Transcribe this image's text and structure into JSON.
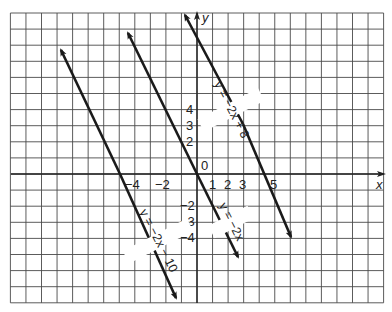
{
  "axes": {
    "x_label": "x",
    "y_label": "y",
    "origin_label": "0",
    "x_tick_labels": [
      {
        "value": -4,
        "text": "−4"
      },
      {
        "value": -2,
        "text": "−2"
      },
      {
        "value": 1,
        "text": "1"
      },
      {
        "value": 2,
        "text": "2"
      },
      {
        "value": 3,
        "text": "3"
      },
      {
        "value": 5,
        "text": "5"
      }
    ],
    "y_tick_labels": [
      {
        "value": 4,
        "text": "4"
      },
      {
        "value": 3,
        "text": "3"
      },
      {
        "value": 2,
        "text": "2"
      },
      {
        "value": -2,
        "text": "−2"
      },
      {
        "value": -3,
        "text": "−3"
      },
      {
        "value": -4,
        "text": "−4"
      }
    ]
  },
  "lines": [
    {
      "name": "y = -2x + 8",
      "label": "y = −2x + 8",
      "slope": -2,
      "intercept": 8
    },
    {
      "name": "y = -2x",
      "label": "y = −2x",
      "slope": -2,
      "intercept": 0
    },
    {
      "name": "y = -2x - 10",
      "label": "y = −2x − 10",
      "slope": -2,
      "intercept": -10
    }
  ],
  "chart_data": {
    "type": "line",
    "title": "",
    "xlabel": "x",
    "ylabel": "y",
    "xlim": [
      -12,
      12
    ],
    "ylim": [
      -8,
      10
    ],
    "grid": true,
    "series": [
      {
        "name": "y = -2x + 8",
        "x": [
          -0.8,
          6.1
        ],
        "y": [
          9.6,
          -4.2
        ]
      },
      {
        "name": "y = -2x",
        "x": [
          -4.4,
          2.6
        ],
        "y": [
          8.8,
          -5.2
        ]
      },
      {
        "name": "y = -2x - 10",
        "x": [
          -8.8,
          -1.35
        ],
        "y": [
          7.8,
          -7.3
        ]
      }
    ]
  }
}
